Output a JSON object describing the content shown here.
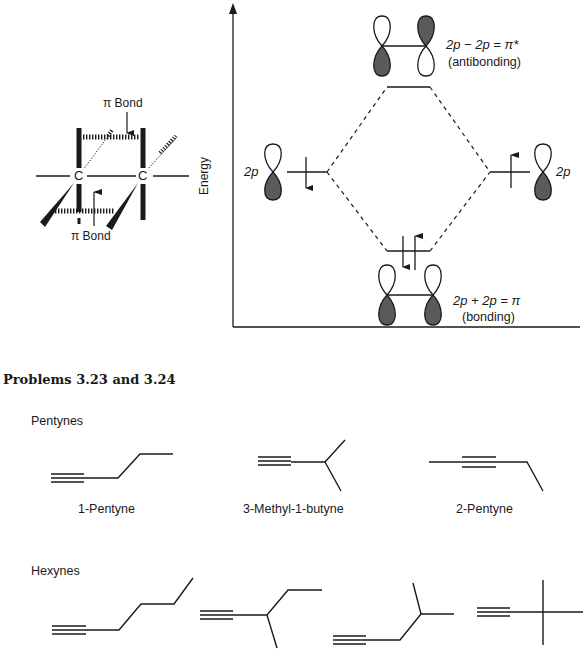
{
  "pi_bond_figure": {
    "top_label": "π Bond",
    "bottom_label": "π Bond",
    "atom_left": "C",
    "atom_right": "C"
  },
  "energy_diagram": {
    "y_axis_label": "Energy",
    "left_orbital_label": "2p",
    "right_orbital_label": "2p",
    "antibonding_equation": "2p − 2p = π*",
    "antibonding_label": "(antibonding)",
    "bonding_equation": "2p + 2p = π",
    "bonding_label": "(bonding)",
    "colors": {
      "shaded_lobe": "#5a5a5a",
      "line": "#1a1a1a"
    }
  },
  "problems": {
    "heading": "Problems 3.23 and 3.24",
    "pentynes": {
      "section_label": "Pentynes",
      "structures": [
        {
          "name": "1-Pentyne"
        },
        {
          "name": "3-Methyl-1-butyne"
        },
        {
          "name": "2-Pentyne"
        }
      ]
    },
    "hexynes": {
      "section_label": "Hexynes",
      "structures": [
        {
          "name": "1-Hexyne"
        },
        {
          "name": "3-Methyl-1-pentyne"
        },
        {
          "name": "4-Methyl-1-pentyne"
        },
        {
          "name": "3,3-Dimethyl-1-butyne"
        }
      ]
    }
  }
}
